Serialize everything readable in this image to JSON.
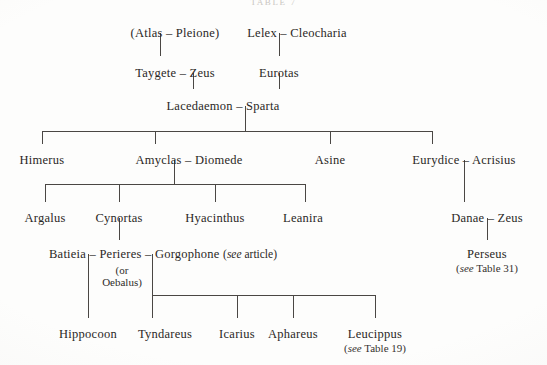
{
  "document": {
    "title": "TABLE 7",
    "type": "genealogical-table",
    "page_background": "#fdfdfc",
    "ink_color": "#2a2725",
    "rule_color": "#4a4744"
  },
  "generations": [
    {
      "level": 1,
      "nodes": [
        {
          "id": "atlas-pleione",
          "text": "(Atlas – Pleione)",
          "x": 175,
          "y": 26
        },
        {
          "id": "lelex-cleocharia",
          "text": "Lelex – Cleocharia",
          "x": 297,
          "y": 26
        }
      ]
    },
    {
      "level": 2,
      "nodes": [
        {
          "id": "taygete-zeus",
          "text": "Taygete – Zeus",
          "x": 175,
          "y": 66
        },
        {
          "id": "eurotas",
          "text": "Eurotas",
          "x": 279,
          "y": 66
        }
      ]
    },
    {
      "level": 3,
      "nodes": [
        {
          "id": "lacedaemon-sparta",
          "text": "Lacedaemon – Sparta",
          "x": 223,
          "y": 99
        }
      ]
    },
    {
      "level": 4,
      "nodes": [
        {
          "id": "himerus",
          "text": "Himerus",
          "x": 42,
          "y": 153
        },
        {
          "id": "amyclas-diomede",
          "text": "Amyclas – Diomede",
          "x": 189,
          "y": 153
        },
        {
          "id": "asine",
          "text": "Asine",
          "x": 330,
          "y": 153
        },
        {
          "id": "eurydice-acrisius",
          "text": "Eurydice – Acrisius",
          "x": 464,
          "y": 153
        }
      ]
    },
    {
      "level": 5,
      "nodes": [
        {
          "id": "argalus",
          "text": "Argalus",
          "x": 45,
          "y": 211
        },
        {
          "id": "cynortas",
          "text": "Cynortas",
          "x": 119,
          "y": 211
        },
        {
          "id": "hyacinthus",
          "text": "Hyacinthus",
          "x": 215,
          "y": 211
        },
        {
          "id": "leanira",
          "text": "Leanira",
          "x": 303,
          "y": 211
        },
        {
          "id": "danae-zeus",
          "text": "Danae – Zeus",
          "x": 487,
          "y": 211
        }
      ]
    },
    {
      "level": 6,
      "nodes": [
        {
          "id": "batieia-perieres-gorgophone",
          "x": 163,
          "y": 247,
          "text": "Batieia – Perieres – Gorgophone ",
          "annotation_italic": "see",
          "annotation_rest": " article)",
          "annotation_open": "("
        },
        {
          "id": "perseus",
          "x": 487,
          "y": 247,
          "text": "Perseus",
          "annotation_italic": "see",
          "annotation_rest": " Table 31)",
          "annotation_open": "("
        }
      ]
    },
    {
      "level": 7,
      "nodes": [
        {
          "id": "hippocoon",
          "text": "Hippocoon",
          "x": 88,
          "y": 327
        },
        {
          "id": "tyndareus",
          "text": "Tyndareus",
          "x": 165,
          "y": 327
        },
        {
          "id": "icarius",
          "text": "Icarius",
          "x": 237,
          "y": 327
        },
        {
          "id": "aphareus",
          "text": "Aphareus",
          "x": 293,
          "y": 327
        },
        {
          "id": "leucippus",
          "text": "Leucippus",
          "x": 375,
          "y": 327,
          "annotation_italic": "see",
          "annotation_rest": " Table 19)",
          "annotation_open": "("
        }
      ]
    }
  ],
  "annotations": {
    "or_oebalus": {
      "line1": "(or",
      "line2": "Oebalus)",
      "x": 122,
      "y": 265
    },
    "see_article": "(see article)",
    "see_table_31": "(see Table 31)",
    "see_table_19": "(see Table 19)"
  },
  "connectors": {
    "description": "vertical drops and horizontal sibling bars of the family tree",
    "segments": [
      {
        "id": "atlas-to-taygete",
        "type": "vertical",
        "x": 160,
        "y1": 33,
        "y2": 56
      },
      {
        "id": "lelex-to-eurotas",
        "type": "vertical",
        "x": 279,
        "y1": 33,
        "y2": 56
      },
      {
        "id": "taygete-zeus-to-lacedaemon",
        "type": "vertical",
        "x": 193,
        "y1": 73,
        "y2": 89
      },
      {
        "id": "eurotas-to-sparta",
        "type": "vertical",
        "x": 279,
        "y1": 73,
        "y2": 89
      },
      {
        "id": "lacedaemon-drop",
        "type": "vertical",
        "x": 245,
        "y1": 106,
        "y2": 131
      },
      {
        "id": "gen4-bar",
        "type": "horizontal",
        "x1": 42,
        "x2": 432,
        "y": 131
      },
      {
        "id": "gen4-drop-himerus",
        "type": "vertical",
        "x": 42,
        "y1": 131,
        "y2": 144
      },
      {
        "id": "gen4-drop-amyclas",
        "type": "vertical",
        "x": 155,
        "y1": 131,
        "y2": 144
      },
      {
        "id": "gen4-drop-asine",
        "type": "vertical",
        "x": 330,
        "y1": 131,
        "y2": 144
      },
      {
        "id": "gen4-drop-eurydice",
        "type": "vertical",
        "x": 432,
        "y1": 131,
        "y2": 144
      },
      {
        "id": "amyclas-drop",
        "type": "vertical",
        "x": 174,
        "y1": 160,
        "y2": 184
      },
      {
        "id": "gen5-bar",
        "type": "horizontal",
        "x1": 45,
        "x2": 305,
        "y": 184
      },
      {
        "id": "gen5-drop-argalus",
        "type": "vertical",
        "x": 45,
        "y1": 184,
        "y2": 202
      },
      {
        "id": "gen5-drop-cynortas",
        "type": "vertical",
        "x": 119,
        "y1": 184,
        "y2": 202
      },
      {
        "id": "gen5-drop-hyacinthus",
        "type": "vertical",
        "x": 215,
        "y1": 184,
        "y2": 202
      },
      {
        "id": "gen5-drop-leanira",
        "type": "vertical",
        "x": 305,
        "y1": 184,
        "y2": 202
      },
      {
        "id": "eurydice-to-danae",
        "type": "vertical",
        "x": 464,
        "y1": 160,
        "y2": 202
      },
      {
        "id": "danae-to-perseus",
        "type": "vertical",
        "x": 487,
        "y1": 218,
        "y2": 240
      },
      {
        "id": "cynortas-to-perieres",
        "type": "vertical",
        "x": 119,
        "y1": 218,
        "y2": 240
      },
      {
        "id": "batieia-to-hippocoon",
        "type": "vertical",
        "x": 88,
        "y1": 254,
        "y2": 318
      },
      {
        "id": "perieres-drop",
        "type": "vertical",
        "x": 152,
        "y1": 254,
        "y2": 295
      },
      {
        "id": "gen7-bar",
        "type": "horizontal",
        "x1": 152,
        "x2": 375,
        "y": 295
      },
      {
        "id": "gen7-drop-tyndareus",
        "type": "vertical",
        "x": 152,
        "y1": 295,
        "y2": 318
      },
      {
        "id": "gen7-drop-icarius",
        "type": "vertical",
        "x": 237,
        "y1": 295,
        "y2": 318
      },
      {
        "id": "gen7-drop-aphareus",
        "type": "vertical",
        "x": 293,
        "y1": 295,
        "y2": 318
      },
      {
        "id": "gen7-drop-leucippus",
        "type": "vertical",
        "x": 375,
        "y1": 295,
        "y2": 318
      }
    ]
  }
}
